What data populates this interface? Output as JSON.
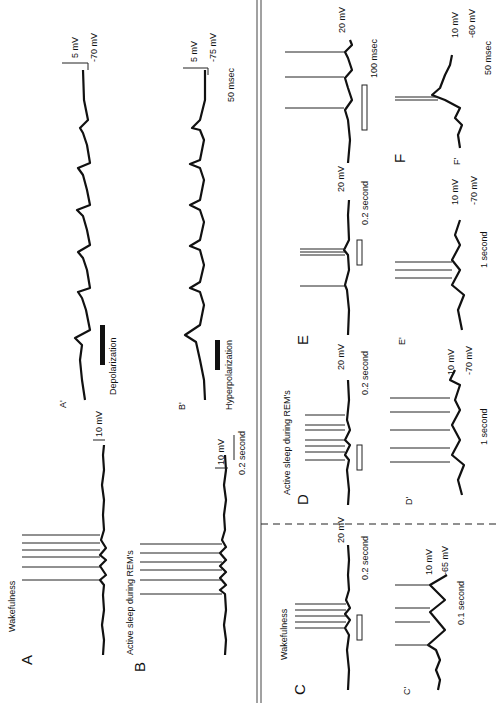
{
  "figure": {
    "orientation": "rotated 90 degrees counter-clockwise",
    "panels": {
      "A": {
        "letter": "A",
        "state": "Wakefulness",
        "scale_v": "10 mV"
      },
      "B": {
        "letter": "B",
        "state": "Active sleep during REM's",
        "scale_v": "10 mV",
        "scale_t": "0.2 second"
      },
      "A_prime": {
        "letter": "A'",
        "scale_v": "5 mV",
        "resting": "-70 mV",
        "bar_label": "Depolarization"
      },
      "B_prime": {
        "letter": "B'",
        "scale_v": "5 mV",
        "resting": "-75 mV",
        "scale_t": "50 msec",
        "bar_label": "Hyperpolarization"
      },
      "C": {
        "letter": "C",
        "state": "Wakefulness",
        "scale_v": "20 mV",
        "scale_t": "0.2 second"
      },
      "C_prime": {
        "letter": "C'",
        "scale_v": "10 mV",
        "resting": "-65 mV",
        "scale_t": "0.1 second"
      },
      "D": {
        "letter": "D",
        "state": "Active sleep during REM's",
        "scale_v": "20 mV",
        "scale_t": "0.2 second"
      },
      "D_prime": {
        "letter": "D'",
        "scale_v": "10 mV",
        "resting": "-70 mV",
        "scale_t": "1 second"
      },
      "E": {
        "letter": "E",
        "scale_v": "20 mV",
        "scale_t": "0.2 second"
      },
      "E_prime": {
        "letter": "E'",
        "scale_v": "10 mV",
        "resting": "-70 mV",
        "scale_t": "1 second"
      },
      "F": {
        "letter": "F",
        "scale_v": "20 mV",
        "scale_t": "100 msec"
      },
      "F_prime": {
        "letter": "F'",
        "scale_v": "10 mV",
        "resting": "-60 mV",
        "scale_t": "50 msec"
      }
    }
  }
}
